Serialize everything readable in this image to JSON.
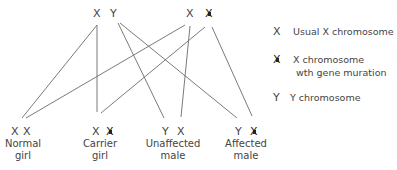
{
  "parents": {
    "father": [
      "X",
      "Y"
    ],
    "mother": [
      "X",
      "X"
    ]
  },
  "offspring": [
    {
      "chromosomes": [
        "X",
        "X"
      ],
      "label_line1": "Normal",
      "label_line2": "girl"
    },
    {
      "chromosomes": [
        "X",
        "X"
      ],
      "label_line1": "Carrier",
      "label_line2": "girl"
    },
    {
      "chromosomes": [
        "Y",
        "X"
      ],
      "label_line1": "Unaffected",
      "label_line2": "male"
    },
    {
      "chromosomes": [
        "Y",
        "X"
      ],
      "label_line1": "Affected",
      "label_line2": "male"
    }
  ],
  "legend": {
    "usual_x": {
      "symbol": "X",
      "text": "Usual X chromosome"
    },
    "mutated_x": {
      "symbol": "X",
      "text_line1": "X chromosome",
      "text_line2": "wth gene muration"
    },
    "y": {
      "symbol": "Y",
      "text": "Y chromosome"
    }
  },
  "colors": {
    "line": "#6b6b6b",
    "text": "#444444"
  }
}
